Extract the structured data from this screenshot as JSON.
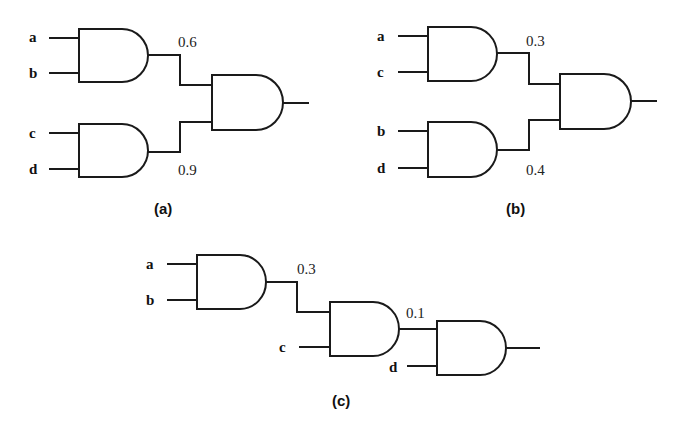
{
  "diagrams": {
    "a": {
      "caption": "(a)",
      "inputs": [
        "a",
        "b",
        "c",
        "d"
      ],
      "probabilities": [
        "0.6",
        "0.9"
      ]
    },
    "b": {
      "caption": "(b)",
      "inputs": [
        "a",
        "c",
        "b",
        "d"
      ],
      "probabilities": [
        "0.3",
        "0.4"
      ]
    },
    "c": {
      "caption": "(c)",
      "inputs": [
        "a",
        "b",
        "c",
        "d"
      ],
      "probabilities": [
        "0.3",
        "0.1"
      ]
    }
  },
  "colors": {
    "line": "#1a1a1a",
    "background": "#ffffff"
  }
}
